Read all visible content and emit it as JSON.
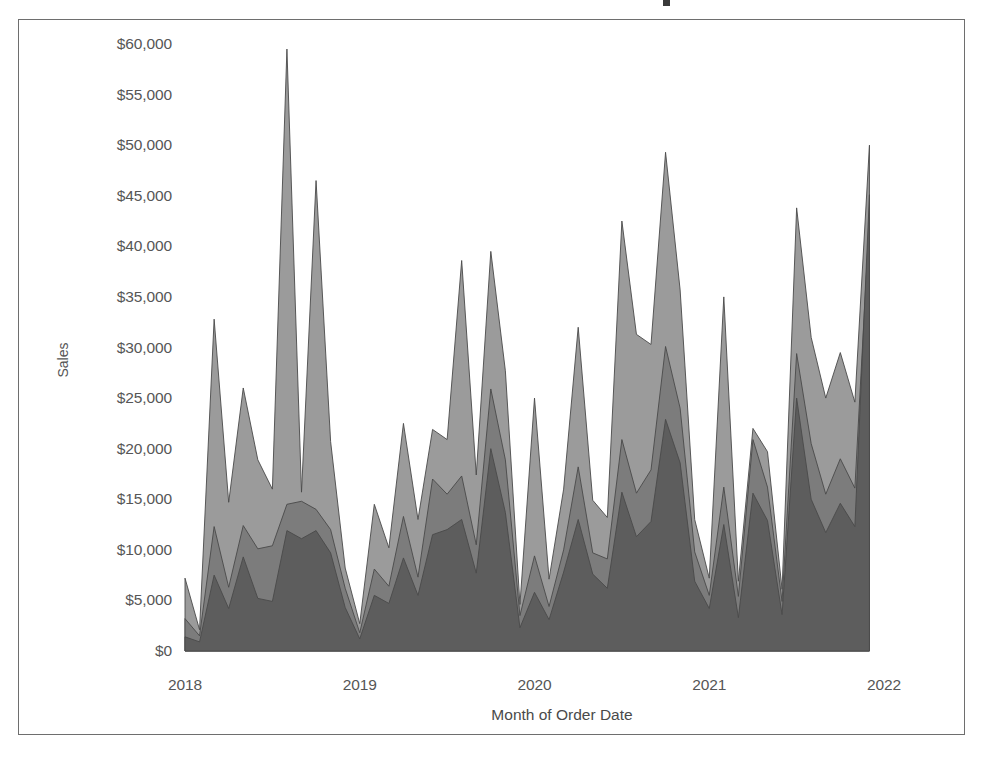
{
  "chart_data": {
    "type": "area",
    "title": "",
    "subtitle": "",
    "xlabel": "Month of Order Date",
    "ylabel": "Sales",
    "xlim": [
      2018.0,
      2022.0
    ],
    "ylim": [
      0,
      60000
    ],
    "grid": false,
    "legend_position": "none",
    "overlap_mode": "overlapping",
    "x_tick_labels": [
      "2018",
      "2019",
      "2020",
      "2021",
      "2022"
    ],
    "x_tick_values": [
      2018,
      2019,
      2020,
      2021,
      2022
    ],
    "y_tick_labels": [
      "$0",
      "$5,000",
      "$10,000",
      "$15,000",
      "$20,000",
      "$25,000",
      "$30,000",
      "$35,000",
      "$40,000",
      "$45,000",
      "$50,000",
      "$55,000",
      "$60,000"
    ],
    "y_tick_values": [
      0,
      5000,
      10000,
      15000,
      20000,
      25000,
      30000,
      35000,
      40000,
      45000,
      50000,
      55000,
      60000
    ],
    "x": [
      2018.0,
      2018.0833,
      2018.1667,
      2018.25,
      2018.3333,
      2018.4167,
      2018.5,
      2018.5833,
      2018.6667,
      2018.75,
      2018.8333,
      2018.9167,
      2019.0,
      2019.0833,
      2019.1667,
      2019.25,
      2019.3333,
      2019.4167,
      2019.5,
      2019.5833,
      2019.6667,
      2019.75,
      2019.8333,
      2019.9167,
      2020.0,
      2020.0833,
      2020.1667,
      2020.25,
      2020.3333,
      2020.4167,
      2020.5,
      2020.5833,
      2020.6667,
      2020.75,
      2020.8333,
      2020.9167,
      2021.0,
      2021.0833,
      2021.1667,
      2021.25,
      2021.3333,
      2021.4167,
      2021.5,
      2021.5833,
      2021.6667,
      2021.75,
      2021.8333,
      2021.9167
    ],
    "series": [
      {
        "name": "Series 1",
        "color": "#9b9b9b",
        "values": [
          7200,
          2100,
          32800,
          14700,
          26000,
          18900,
          16000,
          59500,
          15700,
          46500,
          20700,
          8200,
          2700,
          14500,
          10200,
          22500,
          13000,
          21900,
          20900,
          38600,
          17400,
          39500,
          27700,
          4600,
          25000,
          7100,
          16000,
          32000,
          14900,
          13200,
          42500,
          31300,
          30300,
          49300,
          35700,
          13000,
          7200,
          35000,
          6900,
          22000,
          19700,
          6100,
          43800,
          31000,
          25000,
          29500,
          24600,
          50000
        ]
      },
      {
        "name": "Series 2",
        "color": "#7c7c7c",
        "values": [
          3200,
          1500,
          12300,
          6300,
          12400,
          10100,
          10400,
          14500,
          14800,
          14000,
          12000,
          6200,
          1800,
          8100,
          6400,
          13300,
          7300,
          17000,
          15500,
          17300,
          10500,
          25900,
          18900,
          3500,
          9400,
          4400,
          10000,
          18200,
          9700,
          9100,
          20900,
          15600,
          17900,
          30100,
          24000,
          9800,
          5500,
          16200,
          5400,
          20900,
          16200,
          4900,
          29400,
          20500,
          15500,
          19000,
          16100,
          42900
        ]
      },
      {
        "name": "Series 3",
        "color": "#5d5d5d",
        "values": [
          1400,
          900,
          7500,
          4200,
          9300,
          5200,
          4900,
          11900,
          11100,
          11900,
          9700,
          4300,
          1200,
          5500,
          4700,
          9200,
          5500,
          11500,
          12000,
          13000,
          7700,
          20000,
          13700,
          2300,
          5800,
          3100,
          7800,
          13000,
          7600,
          6200,
          15700,
          11300,
          12800,
          22900,
          18600,
          6900,
          4200,
          12500,
          3300,
          15600,
          12900,
          3600,
          25000,
          15000,
          11700,
          14600,
          12300,
          45100
        ]
      }
    ]
  },
  "layout": {
    "plot_left": 185,
    "plot_right": 884,
    "plot_top": 44,
    "plot_bottom": 651,
    "y_label_right": 172,
    "x_label_y": 676,
    "x_title_y": 706,
    "x_title_center": 562,
    "y_title_x": 45,
    "y_title_y": 352
  }
}
